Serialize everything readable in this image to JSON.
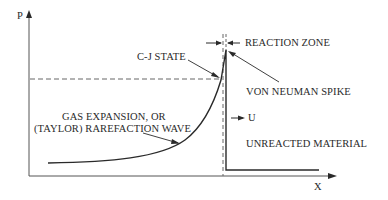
{
  "diagram": {
    "axes": {
      "y_label": "P",
      "x_label": "X"
    },
    "labels": {
      "cj_state": "C-J STATE",
      "reaction_zone": "REACTION ZONE",
      "von_neuman_spike": "VON NEUMAN SPIKE",
      "gas_expansion_line1": "GAS EXPANSION, OR",
      "gas_expansion_line2": "(TAYLOR) RAREFACTION WAVE",
      "velocity": "U",
      "unreacted_material": "UNREACTED MATERIAL"
    },
    "colors": {
      "line": "#2a2a2a",
      "axis": "#555555",
      "dashed": "#666666",
      "background": "#ffffff"
    }
  }
}
